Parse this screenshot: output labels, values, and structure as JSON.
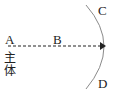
{
  "diagram": {
    "labels": {
      "A": "A",
      "B": "B",
      "C": "C",
      "D": "D",
      "subject_line1": "主",
      "subject_line2": "体"
    },
    "elements": {
      "arc": "curved boundary from C (top) to D (bottom), convex to the right",
      "arrow": "dashed arrow from A through B pointing right to the arc"
    },
    "colors": {
      "arc": "#888888",
      "arrow": "#222222",
      "text": "#222222"
    }
  }
}
